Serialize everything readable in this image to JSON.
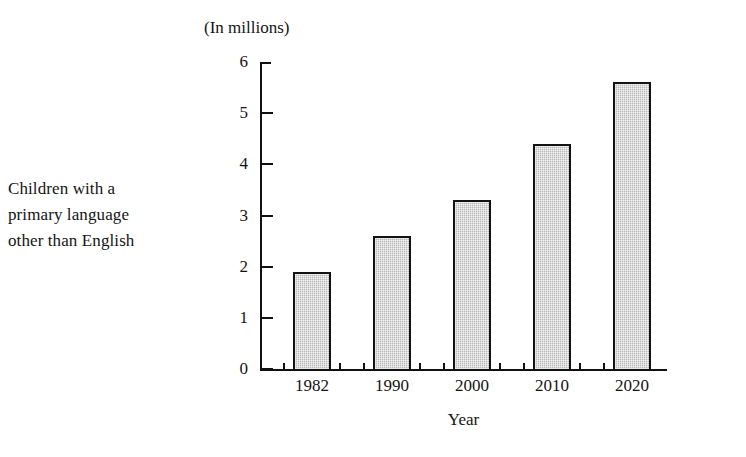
{
  "side_label": {
    "lines": [
      "Children with a",
      "primary language",
      "other than English"
    ]
  },
  "colors": {
    "bar_fill": "#b9b9b9",
    "bar_border": "#121212",
    "axis": "#111111",
    "text": "#141414",
    "background": "#ffffff"
  },
  "chart_data": {
    "type": "bar",
    "title": "(In millions)",
    "xlabel": "Year",
    "ylabel": "",
    "categories": [
      "1982",
      "1990",
      "2000",
      "2010",
      "2020"
    ],
    "values": [
      1.9,
      2.6,
      3.3,
      4.4,
      5.6
    ],
    "ylim": [
      0,
      6
    ],
    "yticks": [
      6,
      5,
      4,
      3,
      2,
      1,
      0
    ],
    "ytick_labels": [
      "6",
      "5",
      "4",
      "3",
      "2",
      "1",
      "0"
    ],
    "grid": false,
    "legend": null,
    "legend_position": "none",
    "annotations": [
      "Children with a primary language other than English"
    ]
  }
}
